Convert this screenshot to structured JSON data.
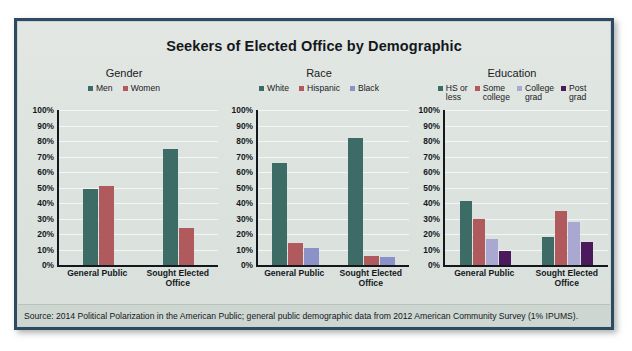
{
  "figure": {
    "title": "Seekers of Elected Office by Demographic",
    "source": "Source: 2014 Political Polarization in the American Public; general public demographic data from 2012 American Community Survey (1% IPUMS).",
    "frame_color": "#2e4a63",
    "background_color": "#dfe4e1"
  },
  "axis": {
    "ticks": [
      "100%",
      "90%",
      "80%",
      "70%",
      "60%",
      "50%",
      "40%",
      "30%",
      "20%",
      "10%",
      "0%"
    ],
    "min": 0,
    "max": 100
  },
  "categories": [
    "General Public",
    "Sought Elected Office"
  ],
  "chart_data": [
    {
      "type": "bar",
      "title": "Gender",
      "xlabel": "",
      "ylabel": "",
      "ylim": [
        0,
        100
      ],
      "grid": true,
      "legend_position": "top",
      "categories": [
        "General Public",
        "Sought Elected Office"
      ],
      "series": [
        {
          "name": "Men",
          "color": "#3d6b66",
          "values": [
            49,
            75
          ]
        },
        {
          "name": "Women",
          "color": "#b05a5e",
          "values": [
            51,
            24
          ]
        }
      ]
    },
    {
      "type": "bar",
      "title": "Race",
      "xlabel": "",
      "ylabel": "",
      "ylim": [
        0,
        100
      ],
      "grid": true,
      "legend_position": "top",
      "categories": [
        "General Public",
        "Sought Elected Office"
      ],
      "series": [
        {
          "name": "White",
          "color": "#3d6b66",
          "values": [
            66,
            82
          ]
        },
        {
          "name": "Hispanic",
          "color": "#b05a5e",
          "values": [
            14,
            6
          ]
        },
        {
          "name": "Black",
          "color": "#8a92c8",
          "values": [
            11,
            5
          ]
        }
      ]
    },
    {
      "type": "bar",
      "title": "Education",
      "xlabel": "",
      "ylabel": "",
      "ylim": [
        0,
        100
      ],
      "grid": true,
      "legend_position": "top",
      "categories": [
        "General Public",
        "Sought Elected Office"
      ],
      "series": [
        {
          "name": "HS or\nless",
          "color": "#3d6b66",
          "values": [
            41,
            18
          ]
        },
        {
          "name": "Some\ncollege",
          "color": "#b05a5e",
          "values": [
            30,
            35
          ]
        },
        {
          "name": "College\ngrad",
          "color": "#a8a8d0",
          "values": [
            17,
            28
          ]
        },
        {
          "name": "Post\ngrad",
          "color": "#4a1a5c",
          "values": [
            9,
            15
          ]
        }
      ]
    }
  ]
}
